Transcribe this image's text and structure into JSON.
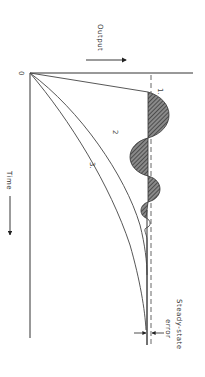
{
  "diagram": {
    "orientation": "rotated 90 degrees clockwise",
    "axes": {
      "origin_label": "0",
      "output_label": "Output",
      "time_label": "Time"
    },
    "curves": [
      {
        "id": "1",
        "label": "1.",
        "description": "underdamped oscillating response with shaded overshoot areas"
      },
      {
        "id": "2",
        "label": "2",
        "description": "critically damped response"
      },
      {
        "id": "3",
        "label": "3.",
        "description": "overdamped response"
      }
    ],
    "annotations": {
      "steady_state_label_line1": "Steady-state",
      "steady_state_label_line2": "error"
    },
    "colors": {
      "line": "#333333",
      "background": "#ffffff",
      "hatch": "#555555"
    }
  }
}
